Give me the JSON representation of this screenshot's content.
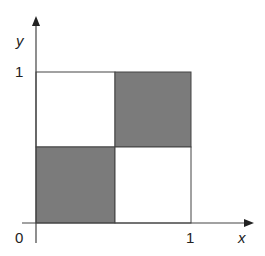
{
  "diagram": {
    "axes": {
      "x_label": "x",
      "y_label": "y",
      "origin_label": "0",
      "x_tick_label": "1",
      "y_tick_label": "1"
    },
    "grid": {
      "cells": [
        {
          "position": "top-left",
          "x_range": [
            0,
            0.5
          ],
          "y_range": [
            0.5,
            1
          ],
          "fill": "white"
        },
        {
          "position": "top-right",
          "x_range": [
            0.5,
            1
          ],
          "y_range": [
            0.5,
            1
          ],
          "fill": "gray"
        },
        {
          "position": "bottom-left",
          "x_range": [
            0,
            0.5
          ],
          "y_range": [
            0,
            0.5
          ],
          "fill": "gray"
        },
        {
          "position": "bottom-right",
          "x_range": [
            0.5,
            1
          ],
          "y_range": [
            0,
            0.5
          ],
          "fill": "white"
        }
      ]
    },
    "colors": {
      "shaded": "#7b7b7b",
      "line": "#444444",
      "background": "#ffffff"
    }
  }
}
